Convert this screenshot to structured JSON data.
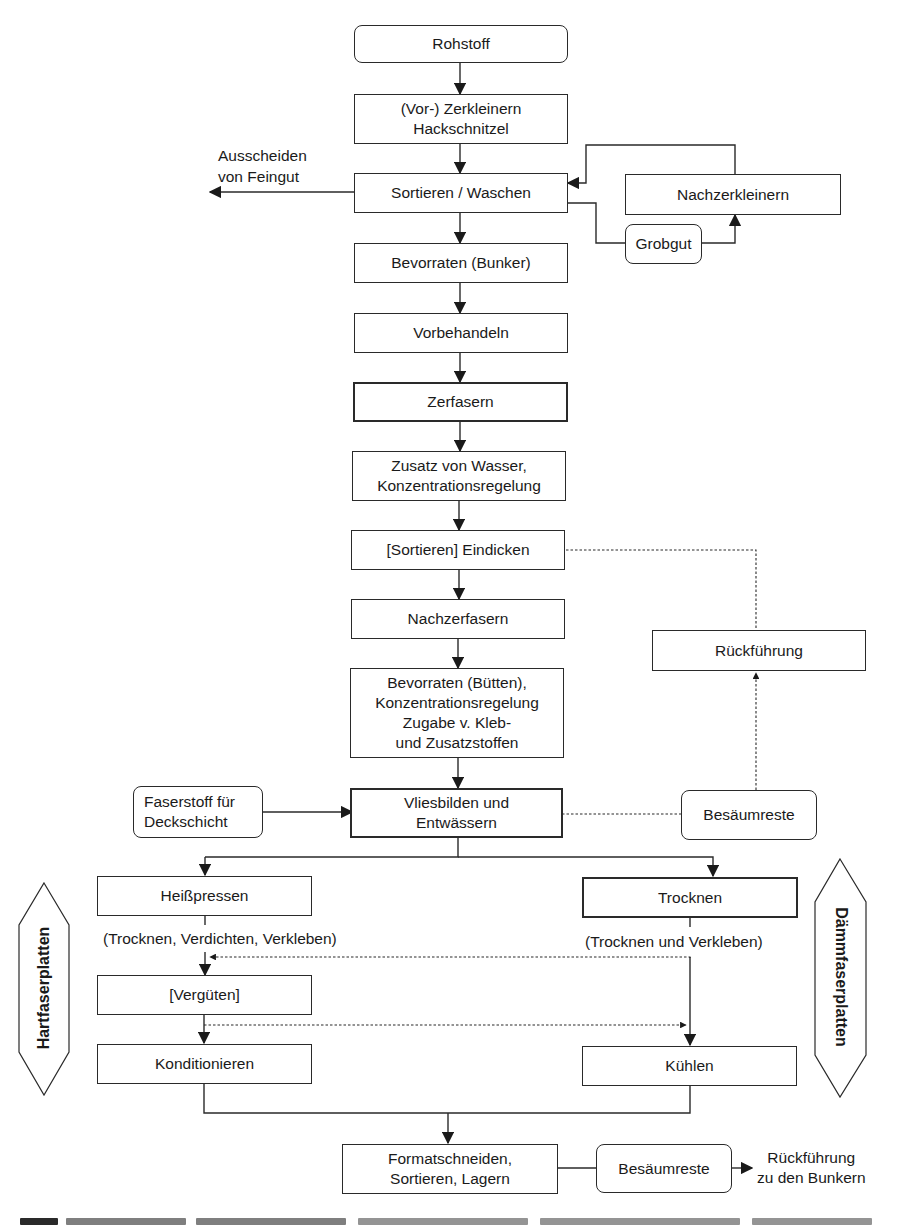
{
  "diagram": {
    "type": "process-flowchart",
    "language": "de",
    "main_flow": {
      "rohstoff": "Rohstoff",
      "zerkleinern": [
        "(Vor-) Zerkleinern",
        "Hackschnitzel"
      ],
      "sortieren": "Sortieren / Waschen",
      "bevorraten_bunker": "Bevorraten (Bunker)",
      "vorbehandeln": "Vorbehandeln",
      "zerfasern": "Zerfasern",
      "zusatz_wasser": [
        "Zusatz von Wasser,",
        "Konzentrationsregelung"
      ],
      "eindicken": "[Sortieren] Eindicken",
      "nachzerfasern": "Nachzerfasern",
      "bevorraten_buetten": [
        "Bevorraten (Bütten),",
        "Konzentrationsregelung",
        "Zugabe v. Kleb-",
        "und Zusatzstoffen"
      ],
      "vliesbilden": [
        "Vliesbilden und",
        "Entwässern"
      ]
    },
    "side_nodes": {
      "ausscheiden": [
        "Ausscheiden",
        "von Feingut"
      ],
      "nachzerkleinern": "Nachzerkleinern",
      "grobgut": "Grobgut",
      "rueckfuehrung": "Rückführung",
      "besaeumreste_upper": "Besäumreste",
      "faserstoff": [
        "Faserstoff für",
        "Deckschicht"
      ]
    },
    "hartfaser_branch": {
      "badge": "Hartfaserplatten",
      "heisspressen": "Heißpressen",
      "note": "(Trocknen, Verdichten, Verkleben)",
      "verguten": "[Vergüten]",
      "konditionieren": "Konditionieren"
    },
    "daemmfaser_branch": {
      "badge": "Dämmfaserplatten",
      "trocknen": "Trocknen",
      "note": "(Trocknen und Verkleben)",
      "kuehlen": "Kühlen"
    },
    "final": {
      "formatschneiden": [
        "Formatschneiden,",
        "Sortieren, Lagern"
      ],
      "besaeumreste_lower": "Besäumreste",
      "rueckfuehrung_bunker": [
        "Rückführung",
        "zu den Bunkern"
      ]
    },
    "colors": {
      "stroke": "#2a2a2a",
      "background": "#ffffff",
      "text": "#1a1a1a"
    }
  }
}
